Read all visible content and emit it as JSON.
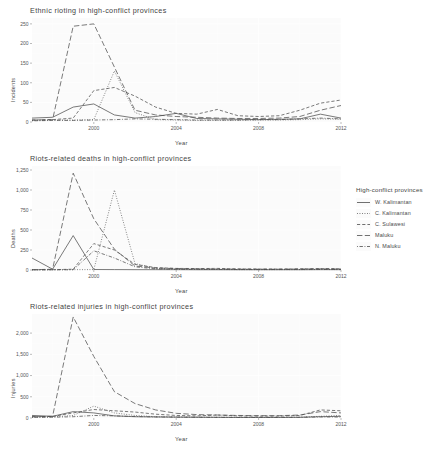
{
  "legend": {
    "title": "High-conflict provinces",
    "items": [
      {
        "label": "W. Kalimantan",
        "dash": "solid"
      },
      {
        "label": "C. Kalimantan",
        "dash": "dotted"
      },
      {
        "label": "C. Sulawesi",
        "dash": "dashed"
      },
      {
        "label": "Maluku",
        "dash": "longdash"
      },
      {
        "label": "N. Maluku",
        "dash": "dotdash"
      }
    ]
  },
  "colors": {
    "line": "#4d4d4d",
    "panel_background": "#fbfbfb",
    "grid": "#f2f2f2",
    "text": "#4a4a4a"
  },
  "chart_data": [
    {
      "type": "line",
      "title": "Ethnic  rioting in high-conflict provinces",
      "xlabel": "Year",
      "ylabel": "Incidents",
      "xlim": [
        1997,
        2012
      ],
      "ylim": [
        0,
        265
      ],
      "xticks": [
        2000,
        2004,
        2008,
        2012
      ],
      "yticks": [
        0,
        50,
        100,
        150,
        200,
        250
      ],
      "ytick_labels": [
        "0",
        "50",
        "100",
        "150",
        "200",
        "250"
      ],
      "grid": true,
      "legend_position": "right",
      "x": [
        1997,
        1998,
        1999,
        2000,
        2001,
        2002,
        2003,
        2004,
        2005,
        2006,
        2007,
        2008,
        2009,
        2010,
        2011,
        2012
      ],
      "series": [
        {
          "name": "W. Kalimantan",
          "dash": "solid",
          "values": [
            10,
            12,
            38,
            46,
            18,
            10,
            14,
            22,
            9,
            8,
            7,
            6,
            7,
            8,
            20,
            10
          ]
        },
        {
          "name": "C. Kalimantan",
          "dash": "dotted",
          "values": [
            4,
            5,
            5,
            6,
            130,
            24,
            6,
            5,
            4,
            4,
            4,
            5,
            5,
            6,
            8,
            7
          ]
        },
        {
          "name": "C. Sulawesi",
          "dash": "dashed",
          "values": [
            5,
            6,
            10,
            80,
            88,
            66,
            38,
            22,
            20,
            32,
            16,
            14,
            16,
            30,
            48,
            56
          ]
        },
        {
          "name": "Maluku",
          "dash": "longdash",
          "values": [
            5,
            6,
            244,
            250,
            140,
            30,
            18,
            14,
            12,
            10,
            9,
            9,
            10,
            14,
            30,
            42
          ]
        },
        {
          "name": "N. Maluku",
          "dash": "dotdash",
          "values": [
            3,
            4,
            4,
            5,
            6,
            8,
            7,
            6,
            5,
            5,
            5,
            6,
            6,
            8,
            10,
            8
          ]
        }
      ]
    },
    {
      "type": "line",
      "title": "Riots-related deaths in high-conflict provinces",
      "xlabel": "Year",
      "ylabel": "Deaths",
      "xlim": [
        1997,
        2012
      ],
      "ylim": [
        0,
        1300
      ],
      "xticks": [
        2000,
        2004,
        2008,
        2012
      ],
      "yticks": [
        0,
        250,
        500,
        750,
        1000,
        1250
      ],
      "ytick_labels": [
        "0",
        "250",
        "500",
        "750",
        "1,000",
        "1,250"
      ],
      "grid": true,
      "legend_position": "right",
      "x": [
        1997,
        1998,
        1999,
        2000,
        2001,
        2002,
        2003,
        2004,
        2005,
        2006,
        2007,
        2008,
        2009,
        2010,
        2011,
        2012
      ],
      "series": [
        {
          "name": "W. Kalimantan",
          "dash": "solid",
          "values": [
            150,
            10,
            430,
            6,
            5,
            4,
            4,
            4,
            3,
            3,
            3,
            3,
            3,
            3,
            4,
            4
          ]
        },
        {
          "name": "C. Kalimantan",
          "dash": "dotted",
          "values": [
            2,
            3,
            4,
            5,
            1000,
            80,
            20,
            10,
            8,
            6,
            5,
            5,
            5,
            5,
            6,
            5
          ]
        },
        {
          "name": "C. Sulawesi",
          "dash": "dashed",
          "values": [
            3,
            4,
            10,
            330,
            250,
            70,
            30,
            20,
            18,
            20,
            14,
            12,
            12,
            14,
            18,
            16
          ]
        },
        {
          "name": "Maluku",
          "dash": "longdash",
          "values": [
            3,
            10,
            1210,
            640,
            260,
            50,
            25,
            18,
            14,
            12,
            10,
            10,
            10,
            12,
            14,
            12
          ]
        },
        {
          "name": "N. Maluku",
          "dash": "dotdash",
          "values": [
            2,
            2,
            3,
            240,
            150,
            40,
            14,
            10,
            8,
            7,
            6,
            6,
            6,
            7,
            8,
            7
          ]
        }
      ]
    },
    {
      "type": "line",
      "title": "Riots-related injuries in high-conflict provinces",
      "xlabel": "Year",
      "ylabel": "Injuries",
      "xlim": [
        1997,
        2012
      ],
      "ylim": [
        0,
        2450
      ],
      "xticks": [
        2000,
        2004,
        2008,
        2012
      ],
      "yticks": [
        0,
        500,
        1000,
        1500,
        2000
      ],
      "ytick_labels": [
        "0",
        "500",
        "1,000",
        "1,500",
        "2,000"
      ],
      "grid": true,
      "legend_position": "right",
      "x": [
        1997,
        1998,
        1999,
        2000,
        2001,
        2002,
        2003,
        2004,
        2005,
        2006,
        2007,
        2008,
        2009,
        2010,
        2011,
        2012
      ],
      "series": [
        {
          "name": "W. Kalimantan",
          "dash": "solid",
          "values": [
            60,
            40,
            150,
            120,
            50,
            30,
            25,
            20,
            18,
            16,
            14,
            14,
            14,
            16,
            30,
            40
          ]
        },
        {
          "name": "C. Kalimantan",
          "dash": "dotted",
          "values": [
            20,
            25,
            60,
            280,
            120,
            60,
            30,
            25,
            20,
            18,
            16,
            16,
            16,
            20,
            40,
            60
          ]
        },
        {
          "name": "C. Sulawesi",
          "dash": "dashed",
          "values": [
            30,
            35,
            120,
            200,
            170,
            140,
            90,
            60,
            50,
            70,
            50,
            45,
            45,
            60,
            190,
            170
          ]
        },
        {
          "name": "Maluku",
          "dash": "longdash",
          "values": [
            30,
            40,
            2380,
            1450,
            620,
            340,
            190,
            110,
            80,
            70,
            60,
            55,
            55,
            70,
            150,
            120
          ]
        },
        {
          "name": "N. Maluku",
          "dash": "dotdash",
          "values": [
            15,
            18,
            30,
            60,
            50,
            35,
            25,
            20,
            16,
            14,
            12,
            12,
            12,
            16,
            25,
            22
          ]
        }
      ]
    }
  ]
}
